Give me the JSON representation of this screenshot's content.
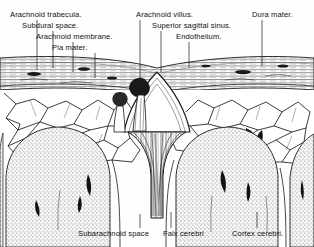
{
  "figure": {
    "style": "engraving",
    "ink_color": "#1a1a1a",
    "paper_color": "#fefefe"
  },
  "labels": {
    "top_left": [
      {
        "id": "arachnoid-trabecula",
        "text": "Arachnoid trabecula.",
        "x": 10,
        "y": 10,
        "leader_x": 37,
        "leader_y1": 20,
        "leader_y2": 70
      },
      {
        "id": "subdural-space",
        "text": "Subdural space.",
        "x": 22,
        "y": 21,
        "leader_x": 53,
        "leader_y1": 31,
        "leader_y2": 68
      },
      {
        "id": "arachnoid-membrane",
        "text": "Arachnoid membrane.",
        "x": 36,
        "y": 32,
        "leader_x": 73,
        "leader_y1": 42,
        "leader_y2": 72
      },
      {
        "id": "pia-mater",
        "text": "Pia mater.",
        "x": 52,
        "y": 43,
        "leader_x": 95,
        "leader_y1": 53,
        "leader_y2": 78
      }
    ],
    "top_right": [
      {
        "id": "arachnoid-villus",
        "text": "Arachnoid villus.",
        "x": 136,
        "y": 10,
        "leader_x": 140,
        "leader_y1": 20,
        "leader_y2": 78
      },
      {
        "id": "superior-sagittal-sinus",
        "text": "Superior sagittal sinus.",
        "x": 152,
        "y": 21,
        "leader_x": 161,
        "leader_y1": 31,
        "leader_y2": 72
      },
      {
        "id": "endothelium",
        "text": "Endothelium.",
        "x": 176,
        "y": 32,
        "leader_x": 189,
        "leader_y1": 42,
        "leader_y2": 68
      },
      {
        "id": "dura-mater",
        "text": "Dura mater.",
        "x": 252,
        "y": 10,
        "leader_x": 262,
        "leader_y1": 20,
        "leader_y2": 66
      }
    ],
    "bottom": [
      {
        "id": "subarachnoid-space",
        "text": "Subarachnoid space",
        "x": 78,
        "y": 231,
        "leader_x": 140,
        "leader_y1": 214,
        "leader_y2": 228
      },
      {
        "id": "falx-cerebri",
        "text": "Falx cerebri",
        "x": 163,
        "y": 231,
        "leader_x": 171,
        "leader_y1": 212,
        "leader_y2": 228
      },
      {
        "id": "cortex-cerebri",
        "text": "Cortex cerebri.",
        "x": 232,
        "y": 231,
        "leader_x": 257,
        "leader_y1": 212,
        "leader_y2": 228
      }
    ]
  },
  "anatomy": {
    "dura_band": {
      "name": "dura mater",
      "top": 58,
      "bottom": 92,
      "hatch": "horizontal"
    },
    "sinus": {
      "name": "superior sagittal sinus",
      "cx": 157,
      "apex_y": 72,
      "half_width": 30,
      "base_y": 132
    },
    "villus": {
      "name": "arachnoid villus",
      "cx": 142,
      "cy": 86
    },
    "falx": {
      "name": "falx cerebri",
      "cx": 157,
      "top_y": 128,
      "bottom_y": 218
    },
    "gyri": [
      {
        "id": "gyrus-left",
        "cx": 62,
        "cy": 185,
        "rx": 58,
        "ry": 72
      },
      {
        "id": "gyrus-mid",
        "cx": 206,
        "cy": 185,
        "rx": 58,
        "ry": 72
      },
      {
        "id": "gyrus-right",
        "cx": 300,
        "cy": 190,
        "rx": 46,
        "ry": 70
      }
    ],
    "subarachnoid_mesh": {
      "name": "subarachnoid space with arachnoid trabeculae",
      "top": 92,
      "bottom": 165
    }
  }
}
